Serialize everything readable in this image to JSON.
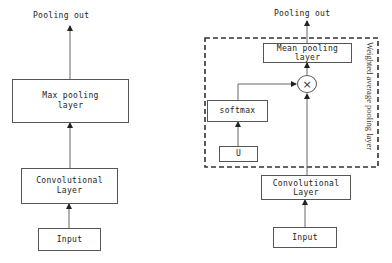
{
  "left_diagram": {
    "output_label": "Pooling out",
    "pooling_box": "Max pooling\nlayer",
    "pooling_line1": "Max pooling",
    "pooling_line2": "layer",
    "conv_line1": "Convolutional",
    "conv_line2": "Layer",
    "input_label": "Input"
  },
  "right_diagram": {
    "output_label": "Pooling out",
    "pooling_line1": "Mean pooling",
    "pooling_line2": "layer",
    "multiply_symbol": "×",
    "softmax_label": "softmax",
    "u_label": "U",
    "group_label": "Weighted average pooling layer",
    "conv_line1": "Convolutional",
    "conv_line2": "Layer",
    "input_label": "Input"
  },
  "colors": {
    "line": "#555555",
    "text": "#222222",
    "background": "#ffffff"
  }
}
